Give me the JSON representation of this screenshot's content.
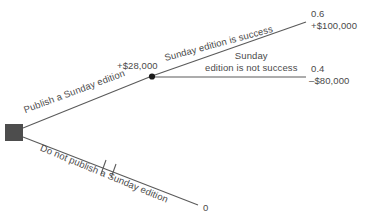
{
  "diagram": {
    "type": "decision-tree",
    "nodes": {
      "decision_node": {
        "shape": "filled-square",
        "color": "#4d4d4d"
      },
      "chance_node": {
        "shape": "filled-circle",
        "color": "#1a1a1a"
      }
    },
    "branches": {
      "publish_label": "Publish a Sunday edition",
      "do_not_publish_label": "Do not publish a Sunday edition",
      "success_label": "Sunday edition is success",
      "not_success_line1": "Sunday",
      "not_success_line2": "edition is not success"
    },
    "values": {
      "expected_value_mid": "+$28,000",
      "probability_success": "0.6",
      "payoff_success": "+$100,000",
      "probability_not_success": "0.4",
      "payoff_not_success": "–$80,000",
      "payoff_do_not_publish": "0"
    },
    "colors": {
      "line": "#5a5a5a",
      "text": "#4a4a4a",
      "decision_node": "#4d4d4d",
      "chance_node": "#1a1a1a",
      "background": "#ffffff"
    }
  }
}
